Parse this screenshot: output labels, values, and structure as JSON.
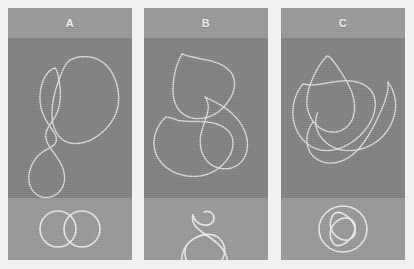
{
  "figure": {
    "background_color": "#f1f1ef",
    "panel_count": 3,
    "panel_bg_dark": "#848484",
    "panel_bg_light": "#9b9b9b",
    "trace_color": "#e8e8e6",
    "label_color": "#f2f2f2"
  },
  "panels": [
    {
      "id": "a",
      "label": "A",
      "conformation_name": "polymer-conformation-a",
      "knot_name": "knot-diagram-a",
      "knot_description": "two-overlapping-circles-link",
      "conformation_paths": [
        "M62,22 C74,16 90,18 99,28 C109,39 112,55 110,68 C108,80 99,92 88,99 C77,106 64,108 55,102 C47,96 44,86 44,76 C44,64 47,52 51,42 C54,33 57,26 62,22 Z",
        "M47,30 C40,32 35,40 33,50 C31,60 32,70 36,78 C39,85 44,91 47,96 C49,100 49,104 46,107 C41,111 34,113 29,119 C23,126 20,135 21,143 C22,151 27,157 34,159 C42,161 50,157 54,150 C58,143 57,134 53,126 C49,118 43,112 40,106 C37,100 37,95 40,90 C43,84 48,79 50,72 C53,63 53,52 51,43 C50,36 49,32 47,30 Z"
      ],
      "knot_paths": [
        "M50,31 m-18,0 a18,18 0 1,0 36,0 a18,18 0 1,0 -36,0",
        "M74,31 m-18,0 a18,18 0 1,0 36,0 a18,18 0 1,0 -36,0"
      ]
    },
    {
      "id": "b",
      "label": "B",
      "conformation_name": "polymer-conformation-b",
      "knot_name": "knot-diagram-b",
      "knot_description": "trefoil-knot-with-loop",
      "conformation_paths": [
        "M38,16 C32,26 29,40 29,52 C29,62 32,70 38,75 C45,81 55,82 64,79 C74,76 82,68 87,59 C91,51 92,43 88,36 C83,28 73,24 63,22 C53,20 43,18 38,16 Z",
        "M22,79 C15,85 10,95 10,105 C10,116 16,126 26,132 C36,138 49,140 61,137 C72,134 81,126 86,117 C90,109 90,101 86,95 C81,88 72,85 63,84 C51,83 40,84 33,82 C28,80 24,79 22,79 Z",
        "M61,59 C69,63 78,67 85,73 C94,80 101,90 103,101 C105,112 101,123 92,128 C83,133 71,131 64,124 C57,117 55,106 57,96 C59,87 63,79 64,72 C65,66 63,62 61,59 Z"
      ],
      "knot_paths": [
        "M60,14 C65,12 70,15 70,20 C70,25 65,28 60,27 C54,26 50,22 49,17",
        "M49,17 C47,24 52,30 58,34 C68,41 78,47 82,57 C87,70 79,83 65,85 C52,87 40,78 38,66",
        "M38,66 C36,55 42,45 51,40 C60,35 70,35 76,41 C83,48 82,60 74,67 C66,74 54,74 47,68 C40,62 39,52 44,45"
      ]
    },
    {
      "id": "c",
      "label": "C",
      "conformation_name": "polymer-conformation-c",
      "knot_name": "knot-diagram-c",
      "knot_description": "figure-eight-knot-in-circle",
      "conformation_paths": [
        "M46,18 C38,26 32,38 28,50 C25,60 25,70 29,78 C33,87 41,93 50,94 C59,95 67,90 71,82 C75,73 74,62 70,52 C65,41 58,31 53,24 C50,20 48,18 46,18 Z",
        "M22,46 C15,54 11,66 12,78 C13,90 19,101 28,107 C38,114 51,114 62,109 C74,104 84,94 90,83 C95,73 96,62 91,54 C85,45 73,42 61,43 C49,44 38,47 31,47 C26,47 24,46 22,46 Z",
        "M32,84 C26,92 24,103 28,112 C32,121 42,126 52,125 C63,124 73,117 80,108 C88,98 94,86 99,75 C104,64 108,53 107,44",
        "M107,44 C113,52 116,63 114,74 C112,86 105,97 95,104 C85,111 72,114 61,112 C50,110 41,103 37,94 C34,87 34,80 37,74"
      ],
      "knot_paths": [
        "M62,8 m-24,23 a24,23 0 1,0 48,0 a24,23 0 1,0 -48,0",
        "M53,16 C48,22 48,30 53,36 C58,42 66,44 71,40 C76,36 75,28 70,22 C65,16 57,12 53,16 Z",
        "M53,46 C48,40 48,32 53,26 C58,20 66,18 71,22 C76,26 75,34 70,40 C65,46 57,50 53,46 Z"
      ]
    }
  ]
}
